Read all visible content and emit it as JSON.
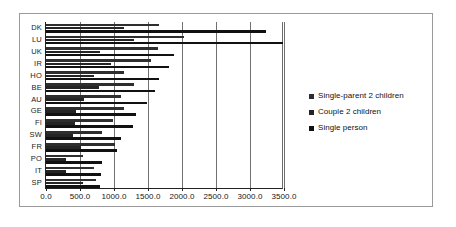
{
  "chart_data": {
    "type": "bar",
    "orientation": "horizontal",
    "title": "",
    "subtitle": "",
    "xlabel": "",
    "ylabel": "",
    "xlim": [
      0.0,
      3500.0
    ],
    "xticks": [
      "0.0",
      "500.0",
      "1000.0",
      "1500.0",
      "2000.0",
      "2500.0",
      "3000.0",
      "3500.0"
    ],
    "xtick_values": [
      0,
      500,
      1000,
      1500,
      2000,
      2500,
      3000,
      3500
    ],
    "grid": true,
    "legend_position": "right",
    "categories": [
      "DK",
      "LU",
      "UK",
      "IR",
      "HO",
      "BE",
      "AU",
      "GE",
      "FI",
      "SW",
      "FR",
      "PO",
      "IT",
      "SP"
    ],
    "series": [
      {
        "name": "Single-parent 2 children",
        "color": "#2e2e2e",
        "values": [
          1660,
          2030,
          1640,
          1540,
          1140,
          1290,
          1110,
          1140,
          980,
          830,
          1010,
          550,
          700,
          730
        ]
      },
      {
        "name": "Couple 2 children",
        "color": "#242424",
        "values": [
          1150,
          1290,
          790,
          960,
          700,
          780,
          560,
          440,
          430,
          390,
          510,
          290,
          300,
          550
        ]
      },
      {
        "name": "Single person",
        "color": "#111111",
        "values": [
          3230,
          3480,
          1880,
          1810,
          1660,
          1610,
          1490,
          1330,
          1280,
          1100,
          1050,
          830,
          810,
          790
        ]
      }
    ]
  },
  "legend": {
    "items": [
      {
        "label": "Single-parent 2 children",
        "color": "#2e2e2e"
      },
      {
        "label": "Couple 2 children",
        "color": "#242424"
      },
      {
        "label": "Single person",
        "color": "#111111"
      }
    ]
  }
}
